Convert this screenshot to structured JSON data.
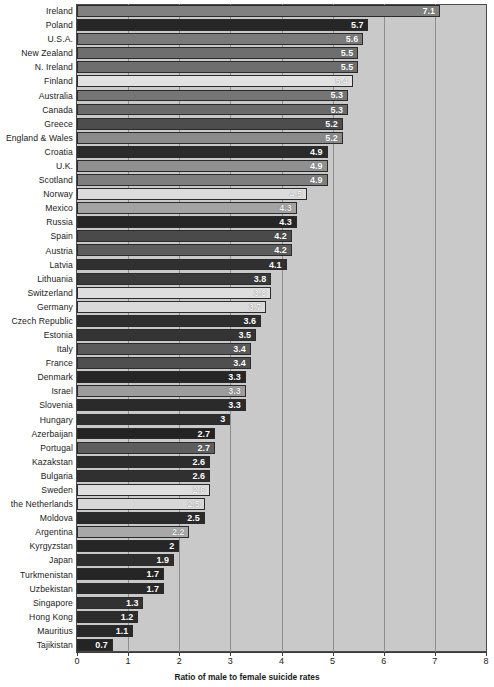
{
  "chart_data": {
    "type": "bar",
    "orientation": "horizontal",
    "title": "",
    "subtitle": "",
    "xlabel": "Ratio of male to female suicide rates",
    "ylabel": "",
    "xlim": [
      0,
      8
    ],
    "xticks": [
      "0",
      "1",
      "2",
      "3",
      "4",
      "5",
      "6",
      "7",
      "8"
    ],
    "xtick_values": [
      0,
      1,
      2,
      3,
      4,
      5,
      6,
      7,
      8
    ],
    "grid": "vertical",
    "legend": "none",
    "plot_background": "#c9c9c9",
    "categories": [
      "Ireland",
      "Poland",
      "U.S.A.",
      "New Zealand",
      "N. Ireland",
      "Finland",
      "Australia",
      "Canada",
      "Greece",
      "England & Wales",
      "Croatia",
      "U.K.",
      "Scotland",
      "Norway",
      "Mexico",
      "Russia",
      "Spain",
      "Austria",
      "Latvia",
      "Lithuania",
      "Switzerland",
      "Germany",
      "Czech Republic",
      "Estonia",
      "Italy",
      "France",
      "Denmark",
      "Israel",
      "Slovenia",
      "Hungary",
      "Azerbaijan",
      "Portugal",
      "Kazakstan",
      "Bulgaria",
      "Sweden",
      "the Netherlands",
      "Moldova",
      "Argentina",
      "Kyrgyzstan",
      "Japan",
      "Turkmenistan",
      "Uzbekistan",
      "Singapore",
      "Hong Kong",
      "Mauritius",
      "Tajikistan"
    ],
    "values": [
      7.1,
      5.7,
      5.6,
      5.5,
      5.5,
      5.4,
      5.3,
      5.3,
      5.2,
      5.2,
      4.9,
      4.9,
      4.9,
      4.5,
      4.3,
      4.3,
      4.2,
      4.2,
      4.1,
      3.8,
      3.8,
      3.7,
      3.6,
      3.5,
      3.4,
      3.4,
      3.3,
      3.3,
      3.3,
      3,
      2.7,
      2.7,
      2.6,
      2.6,
      2.6,
      2.5,
      2.5,
      2.2,
      2,
      1.9,
      1.7,
      1.7,
      1.3,
      1.2,
      1.1,
      0.7
    ],
    "value_labels": [
      "7.1",
      "5.7",
      "5.6",
      "5.5",
      "5.5",
      "5.4",
      "5.3",
      "5.3",
      "5.2",
      "5.2",
      "4.9",
      "4.9",
      "4.9",
      "4.5",
      "4.3",
      "4.3",
      "4.2",
      "4.2",
      "4.1",
      "3.8",
      "3.8",
      "3.7",
      "3.6",
      "3.5",
      "3.4",
      "3.4",
      "3.3",
      "3.3",
      "3.3",
      "3",
      "2.7",
      "2.7",
      "2.6",
      "2.6",
      "2.6",
      "2.5",
      "2.5",
      "2.2",
      "2",
      "1.9",
      "1.7",
      "1.7",
      "1.3",
      "1.2",
      "1.1",
      "0.7"
    ],
    "bar_colors": [
      "#808080",
      "#262626",
      "#7a7a7a",
      "#6e6e6e",
      "#6e6e6e",
      "#e2e2e2",
      "#757575",
      "#6a6a6a",
      "#4d4d4d",
      "#8a8a8a",
      "#2b2b2b",
      "#909090",
      "#7e7e7e",
      "#dcdcdc",
      "#a3a3a3",
      "#262626",
      "#4a4a4a",
      "#5c5c5c",
      "#303030",
      "#3a3a3a",
      "#dedede",
      "#dadada",
      "#2e2e2e",
      "#343434",
      "#5a5a5a",
      "#4f4f4f",
      "#262626",
      "#9c9c9c",
      "#2a2a2a",
      "#2e2e2e",
      "#232323",
      "#5e5e5e",
      "#2c2c2c",
      "#303030",
      "#dedede",
      "#d8d8d8",
      "#2a2a2a",
      "#a8a8a8",
      "#262626",
      "#2e2e2e",
      "#252525",
      "#2a2a2a",
      "#323232",
      "#2c2c2c",
      "#282828",
      "#242424"
    ]
  }
}
